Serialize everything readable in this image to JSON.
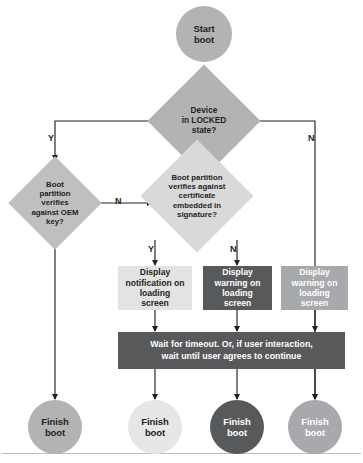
{
  "diagram": {
    "type": "flowchart"
  },
  "colors": {
    "background": "#ffffff",
    "text_dark": "#231f20",
    "text_light": "#ffffff",
    "gray_medium": "#b3b3b3",
    "gray_light": "#d9d9d9",
    "gray_lighter": "#e6e6e6",
    "gray_pale": "#ececec",
    "gray_dark": "#58595b",
    "gray_mid_dark": "#a7a9ac",
    "line": "#231f20",
    "rule": "#bcbec0"
  },
  "nodes": {
    "start": {
      "label": "Start\nboot",
      "shape": "circle",
      "fill": "#b3b3b3",
      "text_color": "#231f20"
    },
    "decision_locked": {
      "label": "Device\nin LOCKED\nstate?",
      "shape": "diamond",
      "fill": "#b3b3b3",
      "text_color": "#231f20"
    },
    "decision_oem_key": {
      "label": "Boot\npartition\nverifies\nagainst OEM\nkey?",
      "shape": "diamond",
      "fill": "#bfbfbf",
      "text_color": "#231f20"
    },
    "decision_certificate": {
      "label": "Boot partition\nverifies against\ncertificate\nembedded in\nsignature?",
      "shape": "diamond",
      "fill": "#d9d9d9",
      "text_color": "#231f20"
    },
    "display_notification": {
      "label": "Display\nnotification on\nloading\nscreen",
      "shape": "rect",
      "fill": "#e3e3e3",
      "text_color": "#231f20"
    },
    "display_warning_dark": {
      "label": "Display\nwarning on\nloading\nscreen",
      "shape": "rect",
      "fill": "#58595b",
      "text_color": "#ffffff"
    },
    "display_warning_gray": {
      "label": "Display\nwarning on\nloading\nscreen",
      "shape": "rect",
      "fill": "#a7a9ac",
      "text_color": "#ffffff"
    },
    "wait_bar": {
      "label": "Wait for timeout. Or, if user interaction,\nwait until user agrees to continue",
      "shape": "rect",
      "fill": "#58595b",
      "text_color": "#ffffff"
    },
    "finish_1": {
      "label": "Finish\nboot",
      "shape": "circle",
      "fill": "#b3b3b3",
      "text_color": "#231f20"
    },
    "finish_2": {
      "label": "Finish\nboot",
      "shape": "circle",
      "fill": "#e6e6e6",
      "text_color": "#231f20"
    },
    "finish_3": {
      "label": "Finish\nboot",
      "shape": "circle",
      "fill": "#58595b",
      "text_color": "#ffffff"
    },
    "finish_4": {
      "label": "Finish\nboot",
      "shape": "circle",
      "fill": "#a7a9ac",
      "text_color": "#ffffff"
    }
  },
  "edge_labels": {
    "locked_yes": "Y",
    "locked_no": "N",
    "oem_key_no": "N",
    "certificate_yes": "Y",
    "certificate_no": "N"
  }
}
